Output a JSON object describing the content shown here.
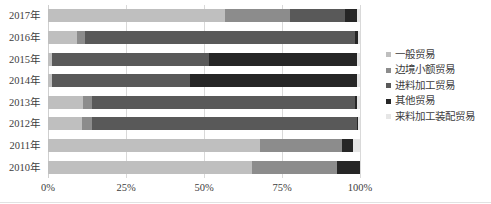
{
  "chart_data": {
    "type": "bar",
    "subtype": "stacked-horizontal-100pct",
    "title": "",
    "xlabel": "",
    "ylabel": "",
    "xlim": [
      0,
      100
    ],
    "xticks": [
      0,
      25,
      50,
      75,
      100
    ],
    "xtick_labels": [
      "0%",
      "25%",
      "50%",
      "75%",
      "100%"
    ],
    "grid": true,
    "legend_position": "right",
    "categories": [
      "2017年",
      "2016年",
      "2015年",
      "2014年",
      "2013年",
      "2012年",
      "2011年",
      "2010年"
    ],
    "series": [
      {
        "name": "一般贸易",
        "color": "#bfbfbf",
        "values": [
          56.7,
          9.3,
          1.2,
          1.2,
          11.2,
          10.9,
          68.0,
          65.4
        ]
      },
      {
        "name": "边境小额贸易",
        "color": "#8c8c8c",
        "values": [
          20.8,
          2.6,
          0.0,
          0.0,
          2.9,
          3.2,
          26.2,
          27.2
        ]
      },
      {
        "name": "进料加工贸易",
        "color": "#595959",
        "values": [
          17.6,
          86.5,
          50.3,
          44.2,
          84.2,
          84.8,
          0.0,
          0.0
        ]
      },
      {
        "name": "其他贸易",
        "color": "#262626",
        "values": [
          3.8,
          1.0,
          47.5,
          53.6,
          0.9,
          0.5,
          3.5,
          7.4
        ]
      },
      {
        "name": "来料加工装配贸易",
        "color": "#e6e6e6",
        "values": [
          1.1,
          0.6,
          1.0,
          1.0,
          0.8,
          0.6,
          2.3,
          0.0
        ]
      }
    ]
  },
  "axis": {
    "y_tick_labels": [
      "2017年",
      "2016年",
      "2015年",
      "2014年",
      "2013年",
      "2012年",
      "2011年",
      "2010年"
    ],
    "x_tick_labels": [
      "0%",
      "25%",
      "50%",
      "75%",
      "100%"
    ]
  },
  "legend": {
    "items": [
      {
        "label": "一般贸易",
        "color": "#bfbfbf"
      },
      {
        "label": "边境小额贸易",
        "color": "#8c8c8c"
      },
      {
        "label": "进料加工贸易",
        "color": "#595959"
      },
      {
        "label": "其他贸易",
        "color": "#262626"
      },
      {
        "label": "来料加工装配贸易",
        "color": "#e6e6e6"
      }
    ]
  },
  "colors": {
    "gridline": "#d9d9d9",
    "text": "#3d3d3d",
    "background": "#ffffff"
  }
}
